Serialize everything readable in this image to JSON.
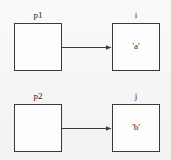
{
  "diagram": {
    "background_color": "#f7f7f7",
    "stroke_color": "#3a3a3a",
    "text_color": "#1e1e1e",
    "nodes": [
      {
        "id": "p1",
        "label": "p1",
        "value": "",
        "role": "pointer"
      },
      {
        "id": "i",
        "label": "i",
        "value": "'a'",
        "role": "variable"
      },
      {
        "id": "p2",
        "label": "p2",
        "value": "",
        "role": "pointer"
      },
      {
        "id": "j",
        "label": "j",
        "value": "'b'",
        "role": "variable"
      }
    ],
    "edges": [
      {
        "from": "p1",
        "to": "i",
        "arrowhead": "filled-triangle"
      },
      {
        "from": "p2",
        "to": "j",
        "arrowhead": "filled-triangle"
      }
    ]
  }
}
